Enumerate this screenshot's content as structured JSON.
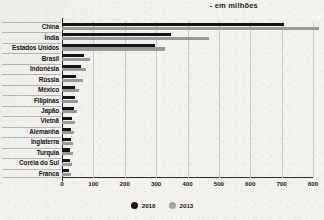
{
  "chart_data": {
    "type": "bar",
    "orientation": "horizontal",
    "title": "- em milhões",
    "xlabel": "",
    "ylabel": "",
    "xlim": [
      0,
      800
    ],
    "xticks": [
      0,
      100,
      200,
      300,
      400,
      500,
      600,
      700,
      800
    ],
    "grid": true,
    "legend_position": "bottom",
    "categories": [
      "China",
      "Índia",
      "Estados Unidos",
      "Brasil",
      "Indonésia",
      "Rússia",
      "México",
      "Filipinas",
      "Japão",
      "Vietnã",
      "Alemanha",
      "Inglaterra",
      "Turquia",
      "Coréia do Sul",
      "França"
    ],
    "series": [
      {
        "name": "2018",
        "color": "#151515",
        "values": [
          708,
          347,
          298,
          70,
          62,
          45,
          42,
          40,
          37,
          32,
          30,
          28,
          26,
          25,
          23
        ]
      },
      {
        "name": "2013",
        "color": "#9a9a98",
        "values": [
          820,
          469,
          328,
          90,
          78,
          68,
          55,
          50,
          47,
          40,
          38,
          36,
          34,
          33,
          30
        ]
      }
    ]
  },
  "legend": {
    "items": [
      {
        "label": "2018",
        "color": "#151515"
      },
      {
        "label": "2013",
        "color": "#a3a3a1"
      }
    ]
  }
}
